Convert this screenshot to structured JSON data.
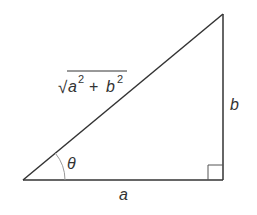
{
  "diagram": {
    "type": "right-triangle",
    "colors": {
      "stroke": "#333333",
      "arc": "#999999",
      "text": "#333333",
      "background": "#ffffff"
    },
    "vertices": {
      "angle_vertex": [
        23,
        180
      ],
      "right_angle_vertex": [
        223,
        180
      ],
      "top_vertex": [
        223,
        14
      ]
    },
    "labels": {
      "adjacent": "a",
      "opposite": "b",
      "angle": "θ",
      "hypotenuse": {
        "radical": "√",
        "term1_base": "a",
        "term1_exp": "2",
        "operator": "+",
        "term2_base": "b",
        "term2_exp": "2"
      }
    }
  }
}
